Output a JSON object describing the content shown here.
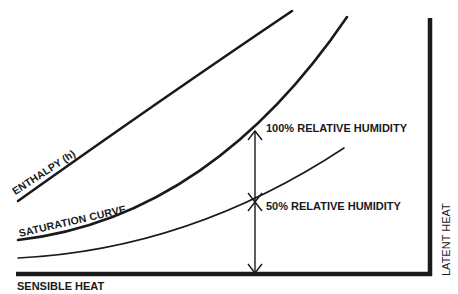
{
  "diagram": {
    "labels": {
      "enthalpy": "ENTHALPY (h)",
      "saturation_curve": "SATURATION CURVE",
      "rh_100": "100% RELATIVE HUMIDITY",
      "rh_50": "50% RELATIVE HUMIDITY",
      "x_axis": "SENSIBLE HEAT",
      "y_axis": "LATENT HEAT"
    },
    "colors": {
      "line": "#1a1a1a",
      "background": "#ffffff"
    },
    "curves": [
      {
        "name": "enthalpy",
        "path": "M 18 201 Q 160 100 292 11",
        "stroke_width": 2.6
      },
      {
        "name": "saturation-curve",
        "path": "M 18 240 C 150 225 260 145 347 17",
        "stroke_width": 2.6
      },
      {
        "name": "rh-50-curve",
        "path": "M 18 258 C 140 252 250 210 344 148",
        "stroke_width": 1.5
      }
    ],
    "axes": {
      "x_axis": {
        "x1": 16,
        "y1": 274,
        "x2": 432,
        "y2": 274
      },
      "y_axis": {
        "x1": 430,
        "y1": 18,
        "x2": 430,
        "y2": 276
      }
    },
    "arrow": {
      "x": 255,
      "y_top": 131,
      "y_bottom": 273,
      "cross_y": 202
    }
  }
}
